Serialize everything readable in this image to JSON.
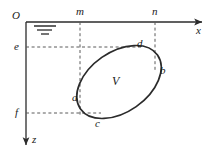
{
  "figure": {
    "background_color": "#ffffff",
    "stroke_color": "#2b2b2b",
    "dashed_color": "#555555",
    "curve_color": "#2b2b2b"
  },
  "axes": {
    "origin_label": "O",
    "x_axis": {
      "label": "x",
      "direction": "right",
      "start_px": 26,
      "end_px": 205,
      "y_px": 22
    },
    "z_axis": {
      "label": "z",
      "direction": "down",
      "x_px": 26,
      "start_px": 22,
      "end_px": 149
    }
  },
  "ticks": {
    "x_ticks": [
      {
        "label": "m",
        "x_px": 80
      },
      {
        "label": "n",
        "x_px": 155
      }
    ],
    "z_ticks": [
      {
        "label": "e",
        "y_px": 47
      },
      {
        "label": "f",
        "y_px": 112
      }
    ]
  },
  "region": {
    "label": "V",
    "shape": "tilted-ellipse",
    "center_px": [
      119,
      82
    ],
    "semi_major_px": 47,
    "semi_minor_px": 30,
    "rotation_deg": -35
  },
  "boundary_points": [
    {
      "label": "a",
      "x_px": 80,
      "y_px": 97,
      "position": "left"
    },
    {
      "label": "b",
      "x_px": 155,
      "y_px": 71,
      "position": "right"
    },
    {
      "label": "c",
      "x_px": 98,
      "y_px": 117,
      "position": "bottom"
    },
    {
      "label": "d",
      "x_px": 138,
      "y_px": 48,
      "position": "top"
    }
  ],
  "symbols": {
    "water_table": {
      "name": "water-table-symbol",
      "x_px": 34,
      "y_px": 24,
      "bars": [
        22,
        15,
        9
      ]
    }
  },
  "guide_lines": [
    {
      "name": "m-vertical",
      "from": [
        80,
        22
      ],
      "to": [
        80,
        117
      ]
    },
    {
      "name": "n-vertical",
      "from": [
        155,
        22
      ],
      "to": [
        155,
        71
      ]
    },
    {
      "name": "e-horizontal",
      "from": [
        26,
        47
      ],
      "to": [
        140,
        47
      ]
    },
    {
      "name": "f-horizontal",
      "from": [
        26,
        113
      ],
      "to": [
        100,
        113
      ]
    }
  ]
}
